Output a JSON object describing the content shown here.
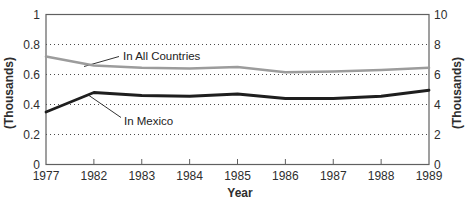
{
  "chart_data": {
    "type": "line",
    "title": "",
    "xlabel": "Year",
    "ylabel_left": "(Thousands)",
    "ylabel_right": "(Thousands)",
    "categories": [
      "1977",
      "1982",
      "1983",
      "1984",
      "1985",
      "1986",
      "1987",
      "1988",
      "1989"
    ],
    "left_axis": {
      "ticks": [
        "1",
        "0.8",
        "0.6",
        "0.4",
        "0.2",
        "0"
      ],
      "values": [
        1,
        0.8,
        0.6,
        0.4,
        0.2,
        0
      ],
      "range": [
        0,
        1
      ]
    },
    "right_axis": {
      "ticks": [
        "10",
        "8",
        "6",
        "4",
        "2",
        "0"
      ],
      "values": [
        10,
        8,
        6,
        4,
        2,
        0
      ],
      "range": [
        0,
        10
      ]
    },
    "grid": {
      "style": "dotted",
      "at_left_values": [
        0.8,
        0.6,
        0.4,
        0.2
      ]
    },
    "legend_position": "inline-annotations",
    "series": [
      {
        "name": "In All Countries",
        "color": "#9c9c9c",
        "width": 2.6,
        "values": [
          0.72,
          0.66,
          0.645,
          0.64,
          0.65,
          0.615,
          0.62,
          0.63,
          0.645
        ]
      },
      {
        "name": "In Mexico",
        "color": "#1e1e1e",
        "width": 2.8,
        "values": [
          0.35,
          0.48,
          0.46,
          0.455,
          0.47,
          0.44,
          0.44,
          0.455,
          0.495
        ]
      }
    ]
  },
  "colors": {
    "axis": "#606060",
    "grid_dots": "#4a4a4a",
    "text": "#2e2e2e",
    "background": "#ffffff"
  }
}
